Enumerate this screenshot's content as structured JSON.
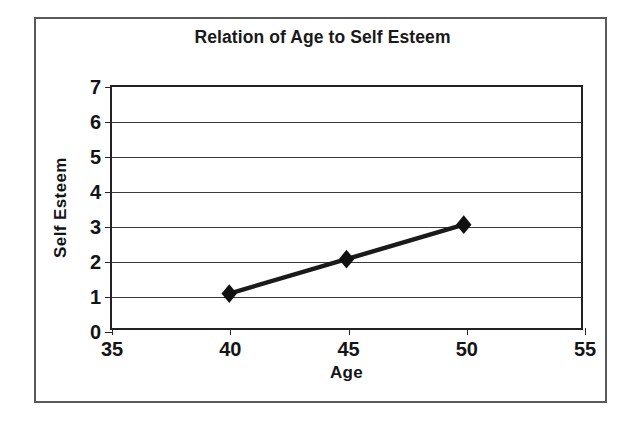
{
  "chart_data": {
    "type": "line",
    "title": "Relation of Age to Self Esteem",
    "xlabel": "Age",
    "ylabel": "Self Esteem",
    "x": [
      40,
      45,
      50
    ],
    "values": [
      1,
      2,
      3
    ],
    "series": [
      {
        "name": "Self Esteem",
        "x": [
          40,
          45,
          50
        ],
        "values": [
          1,
          2,
          3
        ]
      }
    ],
    "points": [
      {
        "x": 40,
        "y": 1
      },
      {
        "x": 45,
        "y": 2
      },
      {
        "x": 50,
        "y": 3
      }
    ],
    "xlim": [
      35,
      55
    ],
    "ylim": [
      0,
      7
    ],
    "xticks": [
      "35",
      "40",
      "45",
      "50",
      "55"
    ],
    "yticks": [
      "0",
      "1",
      "2",
      "3",
      "4",
      "5",
      "6",
      "7"
    ],
    "grid": "horizontal",
    "legend": "none",
    "marker": "diamond",
    "line_color": "#1a1a1a",
    "marker_color": "#111111",
    "grid_color": "#3b3b3f",
    "axis_color": "#222226",
    "frame_color": "#59595c",
    "background": "#ffffff"
  }
}
